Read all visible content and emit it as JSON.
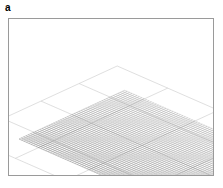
{
  "figure": {
    "panel_label": "a",
    "type": "3d-wireframe-surface-plot",
    "background_color": "#ffffff",
    "frame_color": "#9a9a9a",
    "frame": {
      "x": 8,
      "y": 18,
      "width": 206,
      "height": 158
    }
  },
  "chart_data": {
    "type": "surface",
    "title": "",
    "subtitle": "",
    "xlabel": "",
    "ylabel": "",
    "zlabel": "",
    "grid": true,
    "legend": null,
    "annotations": [],
    "axis_ticks_visible": false,
    "tick_labels": {
      "x": [],
      "y": [],
      "z": []
    },
    "projection": {
      "kind": "isometric-oblique",
      "azimuth_deg": -37,
      "elevation_deg": 24,
      "x_axis_screen": [
        2.42,
        1.06
      ],
      "y_axis_screen": [
        2.3,
        -1.06
      ],
      "z_scale": -0.92,
      "origin_screen": [
        10,
        120
      ]
    },
    "mesh": {
      "nx": 58,
      "ny": 46,
      "line_color": "#2b2b2b",
      "line_width": 0.35,
      "style": "wireframe-net",
      "shading": "depth-cued"
    },
    "floor_grid": {
      "visible": true,
      "color": "#c9c9c9",
      "line_width": 0.6,
      "divisions_x": 4,
      "divisions_y": 4,
      "z_level": 0
    },
    "zlim": [
      0,
      1
    ],
    "xlim": [
      0,
      1
    ],
    "ylim": [
      0,
      1
    ],
    "peaks": [
      {
        "name": "left-massif",
        "cx": 0.17,
        "cy": 0.74,
        "amp": 0.96,
        "sx": 0.26,
        "sy": 0.3
      },
      {
        "name": "left-shoulder",
        "cx": 0.34,
        "cy": 0.88,
        "amp": 0.62,
        "sx": 0.17,
        "sy": 0.17
      },
      {
        "name": "back-ridge",
        "cx": 0.52,
        "cy": 0.95,
        "amp": 0.46,
        "sx": 0.3,
        "sy": 0.12
      },
      {
        "name": "right-peak",
        "cx": 0.9,
        "cy": 0.7,
        "amp": 0.74,
        "sx": 0.15,
        "sy": 0.22
      },
      {
        "name": "right-ridge",
        "cx": 0.8,
        "cy": 0.5,
        "amp": 0.52,
        "sx": 0.13,
        "sy": 0.17
      },
      {
        "name": "front-hump",
        "cx": 0.42,
        "cy": 0.34,
        "amp": 0.55,
        "sx": 0.15,
        "sy": 0.13
      },
      {
        "name": "mid-saddle",
        "cx": 0.6,
        "cy": 0.4,
        "amp": 0.34,
        "sx": 0.14,
        "sy": 0.12
      },
      {
        "name": "left-foot",
        "cx": 0.09,
        "cy": 0.3,
        "amp": 0.3,
        "sx": 0.12,
        "sy": 0.14
      },
      {
        "name": "right-foot",
        "cx": 0.97,
        "cy": 0.3,
        "amp": 0.28,
        "sx": 0.1,
        "sy": 0.13
      },
      {
        "name": "front-plain",
        "cx": 0.5,
        "cy": 0.06,
        "amp": 0.09,
        "sx": 0.4,
        "sy": 0.1
      }
    ],
    "roughness": {
      "amplitude": 0.055,
      "frequency": 7.5,
      "seed": 20410
    }
  }
}
